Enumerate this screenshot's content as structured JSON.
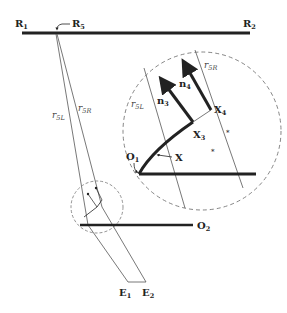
{
  "diagram": {
    "type": "geometric-construction",
    "labels": {
      "R1": {
        "main": "R",
        "sub": "1"
      },
      "R2": {
        "main": "R",
        "sub": "2"
      },
      "R5": {
        "main": "R",
        "sub": "5"
      },
      "r5L_main": {
        "main": "r",
        "sub": "5L"
      },
      "r5R_main": {
        "main": "r",
        "sub": "5R"
      },
      "r5L_zoom": {
        "main": "r",
        "sub": "5L"
      },
      "r5R_zoom": {
        "main": "r",
        "sub": "5R"
      },
      "n3": {
        "main": "n",
        "sub": "3"
      },
      "n4": {
        "main": "n",
        "sub": "4"
      },
      "X3": {
        "main": "X",
        "sub": "3"
      },
      "X4": {
        "main": "X",
        "sub": "4"
      },
      "X": {
        "main": "X"
      },
      "O1": {
        "main": "O",
        "sub": "1"
      },
      "O2": {
        "main": "O",
        "sub": "2"
      },
      "E1": {
        "main": "E",
        "sub": "1"
      },
      "E2": {
        "main": "E",
        "sub": "2"
      }
    },
    "colors": {
      "line": "#222222",
      "thin_line": "#555555",
      "dashed_circle": "#777777"
    }
  }
}
